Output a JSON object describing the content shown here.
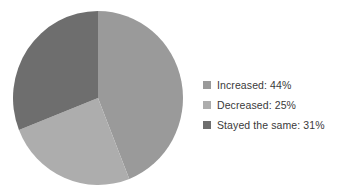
{
  "figure": {
    "background_color": "#ffffff",
    "title": "",
    "width": 349,
    "height": 194
  },
  "legend": {
    "position": "right",
    "text_color": "#3a3a3a",
    "entries": [
      {
        "label": "Increased: 44%",
        "color": "#9a9a9a",
        "swatch_name": "legend-swatch-increased"
      },
      {
        "label": "Decreased: 25%",
        "color": "#adadad",
        "swatch_name": "legend-swatch-decreased"
      },
      {
        "label": "Stayed the same: 31%",
        "color": "#6e6e6e",
        "swatch_name": "legend-swatch-stayed-the-same"
      }
    ]
  },
  "chart_data": {
    "type": "pie",
    "title": "",
    "xlabel": "",
    "ylabel": "",
    "grid": false,
    "legend_position": "right",
    "start_angle_deg": 0,
    "direction": "clockwise",
    "center": {
      "x": 97,
      "y": 98
    },
    "radius": 85,
    "categories": [
      "Increased",
      "Decreased",
      "Stayed the same"
    ],
    "values": [
      44,
      25,
      31
    ],
    "value_unit": "%",
    "labels": [
      "Increased: 44%",
      "Decreased: 25%",
      "Stayed the same: 31%"
    ],
    "colors": [
      "#9a9a9a",
      "#adadad",
      "#6e6e6e"
    ],
    "slices": [
      {
        "name": "Increased",
        "value": 44,
        "display": "44%",
        "color": "#9a9a9a",
        "start_deg": 0,
        "end_deg": 158.4
      },
      {
        "name": "Decreased",
        "value": 25,
        "display": "25%",
        "color": "#adadad",
        "start_deg": 158.4,
        "end_deg": 248.4
      },
      {
        "name": "Stayed the same",
        "value": 31,
        "display": "31%",
        "color": "#6e6e6e",
        "start_deg": 248.4,
        "end_deg": 360
      }
    ]
  }
}
